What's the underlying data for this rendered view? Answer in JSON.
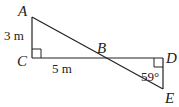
{
  "diagram": {
    "type": "geometry",
    "points": {
      "A": {
        "label": "A"
      },
      "B": {
        "label": "B"
      },
      "C": {
        "label": "C"
      },
      "D": {
        "label": "D"
      },
      "E": {
        "label": "E"
      }
    },
    "measurements": {
      "AC": "3 m",
      "CB": "5 m",
      "angle_E": "59°"
    },
    "right_angles": [
      "C",
      "D"
    ],
    "colors": {
      "stroke": "#222222",
      "background": "#ffffff"
    }
  }
}
